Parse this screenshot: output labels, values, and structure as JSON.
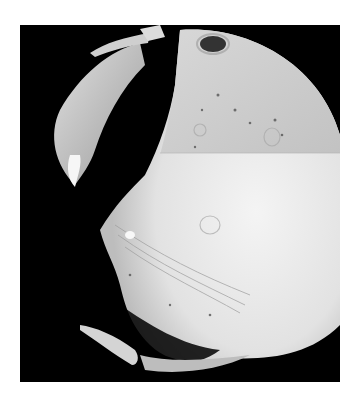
{
  "image": {
    "subject": "Phobos",
    "type": "grayscale photograph",
    "colors": {
      "background": "#ffffff",
      "frame": "#000000",
      "surface_light": "#e8e8e8",
      "surface_upper": "#c8c8c8",
      "crater": "#3a3a3a"
    }
  }
}
